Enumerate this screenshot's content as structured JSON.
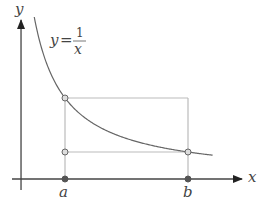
{
  "chart_data": {
    "type": "line",
    "title": "",
    "function": "y = 1/x",
    "curve_label": {
      "lhs": "y",
      "eq": "=",
      "numerator": "1",
      "denominator": "x"
    },
    "xlabel": "x",
    "ylabel": "y",
    "points": {
      "a": 1,
      "b": 3
    },
    "tick_labels": [
      "a",
      "b"
    ],
    "x_range": [
      0.5,
      3.4
    ],
    "axis_origin": {
      "x": 0.285,
      "y": 0
    },
    "marked_points": [
      {
        "name": "curve-point-a",
        "x": 1,
        "y": 1,
        "style": "open"
      },
      {
        "name": "point-a-at-1-over-b",
        "x": 1,
        "y": 0.3333,
        "style": "open"
      },
      {
        "name": "curve-point-b",
        "x": 3,
        "y": 0.3333,
        "style": "open"
      },
      {
        "name": "axis-point-a",
        "x": 1,
        "y": 0,
        "style": "filled"
      },
      {
        "name": "axis-point-b",
        "x": 3,
        "y": 0,
        "style": "filled"
      }
    ],
    "colors": {
      "curve": "#666666",
      "axes": "#444444",
      "guides": "#bbbbbb",
      "points_open_fill": "#dddddd",
      "points_filled": "#555555"
    }
  }
}
